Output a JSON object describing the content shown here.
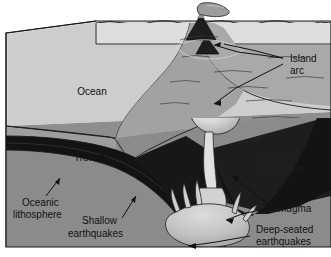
{
  "figure": {
    "background_color": "#ffffff",
    "width": 331,
    "height": 257
  },
  "palette": {
    "ocean_top_surface": "#d8d8d8",
    "ocean_water": "#c9c9c9",
    "seafloor_front_face": "#9a9a9a",
    "mantle_front_face": "#8e8e8e",
    "mantle_right_face": "#8a8a8a",
    "slab_dark": "#141414",
    "magma_light": "#e2e2e2",
    "magma_mid": "#bdbdbd",
    "volcano_dark": "#1b1b1b",
    "outline": "#1a1a1a",
    "label_text": "#111111"
  },
  "labels": [
    {
      "id": "ocean",
      "text": "Ocean",
      "x": 92,
      "y": 92
    },
    {
      "id": "island-arc-line1",
      "text": "Island",
      "x": 290,
      "y": 59
    },
    {
      "id": "island-arc-line2",
      "text": "arc",
      "x": 290,
      "y": 71
    },
    {
      "id": "trench",
      "text": "Trench",
      "x": 74,
      "y": 158
    },
    {
      "id": "oceanic-lithosphere-1",
      "text": "Oceanic",
      "x": 22,
      "y": 203
    },
    {
      "id": "oceanic-lithosphere-2",
      "text": "lithosphere",
      "x": 13,
      "y": 215
    },
    {
      "id": "shallow-eq-line1",
      "text": "Shallow",
      "x": 82,
      "y": 221
    },
    {
      "id": "shallow-eq-line2",
      "text": "earthquakes",
      "x": 68,
      "y": 234
    },
    {
      "id": "magma",
      "text": "Magma",
      "x": 278,
      "y": 209
    },
    {
      "id": "deep-eq-line1",
      "text": "Deep-seated",
      "x": 256,
      "y": 230
    },
    {
      "id": "deep-eq-line2",
      "text": "earthquakes",
      "x": 256,
      "y": 242
    }
  ],
  "faint_labels": [
    {
      "id": "oceanic-lithosphere-faint-1",
      "text": "Oceanic",
      "x": 262,
      "y": 158
    },
    {
      "id": "oceanic-lithosphere-faint-2",
      "text": "lithosphere",
      "x": 256,
      "y": 170
    }
  ],
  "features": {
    "volcano": "erupting island-arc volcano with ash plume at crest",
    "island_arc": "chain of volcanic islands on overriding plate",
    "trench": "deep-sea trench at plate boundary",
    "subducting_slab": "dark oceanic lithosphere descending beneath overriding plate",
    "magma_chamber": "light magma body beneath island arc",
    "deep_magma": "finger-like magma plumes rising from descending slab",
    "shallow_earthquakes": "earthquake zone along shallow part of slab",
    "deep_seated_earthquakes": "earthquake zone along deep part of slab"
  }
}
